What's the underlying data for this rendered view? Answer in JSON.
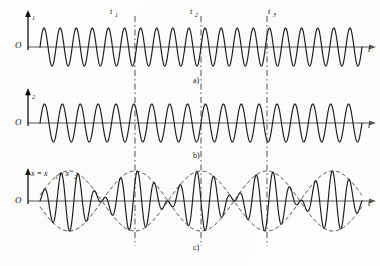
{
  "figure": {
    "caption_labels": [
      "a)",
      "b)",
      "c)"
    ],
    "origin_label": "O",
    "time_axis_label": "t",
    "time_markers": [
      "t",
      "t",
      "t"
    ],
    "time_marker_subs": [
      "1",
      "2",
      "3"
    ],
    "colors": {
      "curve": "#1a1a1a",
      "axis": "#555555",
      "envelope": "#2a2a2a",
      "marker_line": "#3a3a3a",
      "background": "#fdfdfb"
    }
  },
  "panels": [
    {
      "id": "panel-a",
      "label": "a)",
      "y_axis_label": "x",
      "y_axis_sub": "1",
      "origin_label": "O",
      "x_axis_label": "t"
    },
    {
      "id": "panel-b",
      "label": "b)",
      "y_axis_label": "x",
      "y_axis_sub": "2",
      "origin_label": "O",
      "x_axis_label": "t"
    },
    {
      "id": "panel-c",
      "label": "c)",
      "y_axis_label": "x = x",
      "y_axis_sub": "1",
      "y_axis_label2": " + x",
      "y_axis_sub2": "2",
      "origin_label": "O",
      "x_axis_label": "t"
    }
  ],
  "chart_data": {
    "type": "line",
    "title": "",
    "xlabel": "t",
    "ylabel": "x",
    "grid": false,
    "legend": "none",
    "x_range": [
      0,
      1
    ],
    "marker_positions": [
      0.295,
      0.5,
      0.705
    ],
    "marker_labels": [
      "t1",
      "t2",
      "t3"
    ],
    "series": [
      {
        "name": "x1",
        "panel": "a)",
        "type": "sine",
        "amplitude": 1.0,
        "cycles": 20,
        "phase": 0,
        "ylim": [
          -1.2,
          1.2
        ]
      },
      {
        "name": "x2",
        "panel": "b)",
        "type": "sine",
        "amplitude": 1.0,
        "cycles": 18,
        "phase": 0,
        "ylim": [
          -1.2,
          1.2
        ]
      },
      {
        "name": "x = x1 + x2",
        "panel": "c)",
        "type": "beat",
        "amplitude": 2.0,
        "carrier_cycles": 19,
        "envelope_cycles": 1,
        "ylim": [
          -2.3,
          2.3
        ]
      }
    ],
    "envelope": {
      "name": "beat envelope",
      "style": "dashed",
      "panel": "c)",
      "nodes_at": [
        "t2"
      ],
      "antinodes_at": [
        "t1",
        "t3"
      ]
    }
  }
}
